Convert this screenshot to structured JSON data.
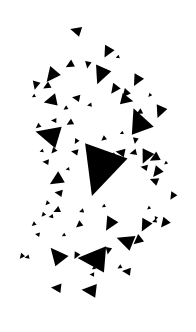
{
  "document": {
    "title": "Triangle Scatter Composition",
    "width": 196,
    "height": 332,
    "background_color": "#FFFFFF",
    "shape_color": "#000000",
    "description": "Abstract black-and-white image: a scatter of solid black triangles of varying sizes and rotations on a plain white background, loosely arranged in a vertical cluster.",
    "shape_count_label": "78 triangles"
  },
  "chart_data": {
    "type": "scatter",
    "title": "Triangle Scatter Composition",
    "subtitle": "",
    "xlabel": "",
    "ylabel": "",
    "xlim": [
      0,
      196
    ],
    "ylim": [
      0,
      332
    ],
    "grid": false,
    "legend": "none",
    "marker": "triangle",
    "marker_color": "#000000",
    "background_color": "#FFFFFF",
    "annotations": [],
    "tick_labels": {
      "x": [],
      "y": []
    },
    "series": [
      {
        "name": "triangles",
        "color": "#000000",
        "points": [
          {
            "id": "t01",
            "cx": 77.0,
            "cy": 31.0,
            "size": 7.0,
            "rot": 196
          },
          {
            "id": "t02",
            "cx": 108.0,
            "cy": 51.0,
            "size": 7.5,
            "rot": 118
          },
          {
            "id": "t03",
            "cx": 70.5,
            "cy": 64.5,
            "size": 5.5,
            "rot": 150
          },
          {
            "id": "t04",
            "cx": 88.0,
            "cy": 64.0,
            "size": 4.5,
            "rot": 100
          },
          {
            "id": "t05",
            "cx": 101.5,
            "cy": 73.5,
            "size": 11.5,
            "rot": 112
          },
          {
            "id": "t06",
            "cx": 52.5,
            "cy": 74.5,
            "size": 9.5,
            "rot": 128
          },
          {
            "id": "t07",
            "cx": 137.5,
            "cy": 79.5,
            "size": 7.5,
            "rot": 118
          },
          {
            "id": "t08",
            "cx": 36.0,
            "cy": 84.5,
            "size": 5.5,
            "rot": 104
          },
          {
            "id": "t09",
            "cx": 47.5,
            "cy": 86.0,
            "size": 5.0,
            "rot": 150
          },
          {
            "id": "t10",
            "cx": 115.0,
            "cy": 88.5,
            "size": 6.5,
            "rot": 126
          },
          {
            "id": "t11",
            "cx": 77.0,
            "cy": 98.0,
            "size": 5.0,
            "rot": 190
          },
          {
            "id": "t12",
            "cx": 126.0,
            "cy": 93.0,
            "size": 5.5,
            "rot": 130
          },
          {
            "id": "t13",
            "cx": 52.0,
            "cy": 100.5,
            "size": 8.5,
            "rot": 166
          },
          {
            "id": "t14",
            "cx": 125.5,
            "cy": 99.5,
            "size": 8.0,
            "rot": 12
          },
          {
            "id": "t15",
            "cx": 160.5,
            "cy": 110.5,
            "size": 8.0,
            "rot": 112
          },
          {
            "id": "t16",
            "cx": 139.5,
            "cy": 123.0,
            "size": 16.0,
            "rot": 248
          },
          {
            "id": "t17",
            "cx": 50.5,
            "cy": 135.5,
            "size": 15.5,
            "rot": 195
          },
          {
            "id": "t18",
            "cx": 38.5,
            "cy": 126.0,
            "size": 3.5,
            "rot": 140
          },
          {
            "id": "t19",
            "cx": 54.5,
            "cy": 120.5,
            "size": 3.5,
            "rot": 180
          },
          {
            "id": "t20",
            "cx": 70.5,
            "cy": 122.5,
            "size": 4.5,
            "rot": 150
          },
          {
            "id": "t21",
            "cx": 76.5,
            "cy": 141.0,
            "size": 3.5,
            "rot": 120
          },
          {
            "id": "t22",
            "cx": 104.0,
            "cy": 138.5,
            "size": 3.5,
            "rot": 140
          },
          {
            "id": "t23",
            "cx": 101.5,
            "cy": 166.5,
            "size": 31.0,
            "rot": 108
          },
          {
            "id": "t24",
            "cx": 54.0,
            "cy": 150.5,
            "size": 4.0,
            "rot": 130
          },
          {
            "id": "t25",
            "cx": 75.5,
            "cy": 152.0,
            "size": 4.5,
            "rot": 190
          },
          {
            "id": "t26",
            "cx": 135.5,
            "cy": 140.0,
            "size": 4.0,
            "rot": 100
          },
          {
            "id": "t27",
            "cx": 121.5,
            "cy": 152.5,
            "size": 6.0,
            "rot": 190
          },
          {
            "id": "t28",
            "cx": 134.0,
            "cy": 152.5,
            "size": 4.5,
            "rot": 165
          },
          {
            "id": "t29",
            "cx": 146.5,
            "cy": 155.5,
            "size": 9.0,
            "rot": 115
          },
          {
            "id": "t30",
            "cx": 155.5,
            "cy": 157.5,
            "size": 6.5,
            "rot": 150
          },
          {
            "id": "t31",
            "cx": 145.0,
            "cy": 167.5,
            "size": 4.5,
            "rot": 190
          },
          {
            "id": "t32",
            "cx": 157.5,
            "cy": 171.5,
            "size": 7.0,
            "rot": 128
          },
          {
            "id": "t33",
            "cx": 155.0,
            "cy": 181.0,
            "size": 5.5,
            "rot": 200
          },
          {
            "id": "t34",
            "cx": 57.5,
            "cy": 179.5,
            "size": 9.0,
            "rot": 148
          },
          {
            "id": "t35",
            "cx": 46.5,
            "cy": 162.0,
            "size": 4.0,
            "rot": 185
          },
          {
            "id": "t36",
            "cx": 59.5,
            "cy": 193.0,
            "size": 5.0,
            "rot": 190
          },
          {
            "id": "t37",
            "cx": 173.0,
            "cy": 195.5,
            "size": 5.0,
            "rot": 122
          },
          {
            "id": "t38",
            "cx": 57.5,
            "cy": 210.0,
            "size": 4.5,
            "rot": 155
          },
          {
            "id": "t39",
            "cx": 43.5,
            "cy": 214.5,
            "size": 3.0,
            "rot": 130
          },
          {
            "id": "t40",
            "cx": 51.5,
            "cy": 216.5,
            "size": 3.0,
            "rot": 170
          },
          {
            "id": "t41",
            "cx": 34.0,
            "cy": 224.0,
            "size": 3.0,
            "rot": 140
          },
          {
            "id": "t42",
            "cx": 79.5,
            "cy": 224.5,
            "size": 4.5,
            "rot": 140
          },
          {
            "id": "t43",
            "cx": 110.5,
            "cy": 223.0,
            "size": 9.0,
            "rot": 120
          },
          {
            "id": "t44",
            "cx": 145.5,
            "cy": 224.5,
            "size": 8.0,
            "rot": 118
          },
          {
            "id": "t45",
            "cx": 155.0,
            "cy": 221.0,
            "size": 3.0,
            "rot": 160
          },
          {
            "id": "t46",
            "cx": 165.0,
            "cy": 222.5,
            "size": 6.5,
            "rot": 128
          },
          {
            "id": "t47",
            "cx": 38.0,
            "cy": 234.5,
            "size": 3.0,
            "rot": 190
          },
          {
            "id": "t48",
            "cx": 127.0,
            "cy": 241.5,
            "size": 11.0,
            "rot": 200
          },
          {
            "id": "t49",
            "cx": 138.5,
            "cy": 240.0,
            "size": 6.5,
            "rot": 140
          },
          {
            "id": "t50",
            "cx": 108.5,
            "cy": 250.0,
            "size": 4.5,
            "rot": 100
          },
          {
            "id": "t51",
            "cx": 22.0,
            "cy": 256.0,
            "size": 3.5,
            "rot": 130
          },
          {
            "id": "t52",
            "cx": 27.5,
            "cy": 257.0,
            "size": 3.0,
            "rot": 165
          },
          {
            "id": "t53",
            "cx": 58.0,
            "cy": 256.5,
            "size": 11.5,
            "rot": 230
          },
          {
            "id": "t54",
            "cx": 76.5,
            "cy": 255.0,
            "size": 4.5,
            "rot": 118
          },
          {
            "id": "t55",
            "cx": 95.5,
            "cy": 259.0,
            "size": 18.0,
            "rot": 183
          },
          {
            "id": "t56",
            "cx": 120.0,
            "cy": 267.0,
            "size": 3.0,
            "rot": 150
          },
          {
            "id": "t57",
            "cx": 127.5,
            "cy": 271.5,
            "size": 5.5,
            "rot": 185
          },
          {
            "id": "t58",
            "cx": 92.5,
            "cy": 274.5,
            "size": 3.0,
            "rot": 180
          },
          {
            "id": "t59",
            "cx": 57.5,
            "cy": 288.0,
            "size": 6.5,
            "rot": 185
          },
          {
            "id": "t60",
            "cx": 91.0,
            "cy": 290.5,
            "size": 9.5,
            "rot": 185
          },
          {
            "id": "t61",
            "cx": 140.0,
            "cy": 112.0,
            "size": 4.0,
            "rot": 150
          },
          {
            "id": "t62",
            "cx": 113.5,
            "cy": 155.0,
            "size": 3.0,
            "rot": 150
          },
          {
            "id": "t63",
            "cx": 82.0,
            "cy": 211.0,
            "size": 3.0,
            "rot": 160
          },
          {
            "id": "t64",
            "cx": 47.5,
            "cy": 203.0,
            "size": 3.0,
            "rot": 130
          },
          {
            "id": "t65",
            "cx": 64.0,
            "cy": 235.0,
            "size": 2.5,
            "rot": 150
          },
          {
            "id": "t66",
            "cx": 156.0,
            "cy": 218.0,
            "size": 2.5,
            "rot": 110
          },
          {
            "id": "t67",
            "cx": 94.0,
            "cy": 268.0,
            "size": 2.5,
            "rot": 150
          },
          {
            "id": "t68",
            "cx": 149.0,
            "cy": 208.0,
            "size": 2.5,
            "rot": 140
          },
          {
            "id": "t69",
            "cx": 66.0,
            "cy": 108.0,
            "size": 3.0,
            "rot": 145
          },
          {
            "id": "t70",
            "cx": 90.0,
            "cy": 105.0,
            "size": 3.0,
            "rot": 170
          },
          {
            "id": "t71",
            "cx": 42.0,
            "cy": 151.0,
            "size": 2.5,
            "rot": 160
          },
          {
            "id": "t72",
            "cx": 122.0,
            "cy": 133.0,
            "size": 2.5,
            "rot": 155
          },
          {
            "id": "t73",
            "cx": 34.0,
            "cy": 96.0,
            "size": 2.5,
            "rot": 150
          },
          {
            "id": "t74",
            "cx": 150.0,
            "cy": 95.0,
            "size": 2.5,
            "rot": 130
          },
          {
            "id": "t75",
            "cx": 118.0,
            "cy": 57.0,
            "size": 2.5,
            "rot": 160
          },
          {
            "id": "t76",
            "cx": 68.0,
            "cy": 169.0,
            "size": 2.5,
            "rot": 170
          },
          {
            "id": "t77",
            "cx": 166.0,
            "cy": 163.0,
            "size": 2.5,
            "rot": 140
          },
          {
            "id": "t78",
            "cx": 104.0,
            "cy": 206.0,
            "size": 2.5,
            "rot": 150
          }
        ]
      }
    ]
  }
}
